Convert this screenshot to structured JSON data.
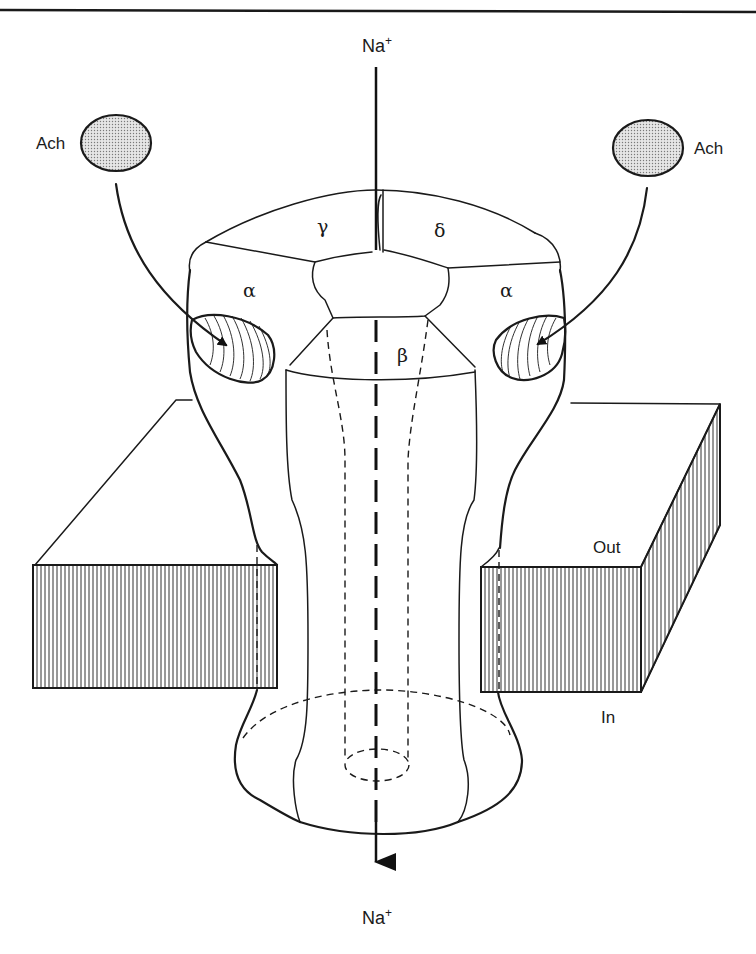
{
  "figure": {
    "top_rule": true
  },
  "labels": {
    "ion_top": "Na",
    "ion_top_charge": "+",
    "ion_bottom": "Na",
    "ion_bottom_charge": "+",
    "ligand_left": "Ach",
    "ligand_right": "Ach",
    "membrane_out": "Out",
    "membrane_in": "In"
  },
  "subunits": {
    "alpha_left": "α",
    "alpha_right": "α",
    "beta": "β",
    "gamma": "γ",
    "delta": "δ"
  },
  "colors": {
    "ink": "#1a1a1a",
    "ligand_fill": "#cfcfcf",
    "background": "#ffffff"
  }
}
